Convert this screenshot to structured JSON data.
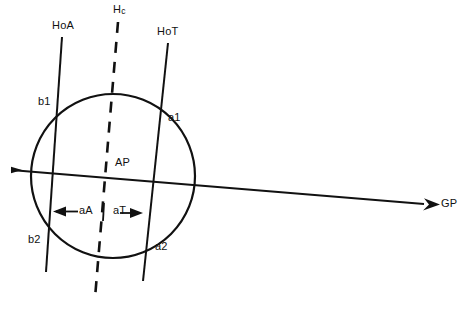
{
  "diagram": {
    "background_color": "#ffffff",
    "line_color": "#111111",
    "labels": {
      "hoa": "HoA",
      "hc_main": "H",
      "hc_sub": "c",
      "hot": "HoT",
      "b1": "b1",
      "a1": "a1",
      "b2": "b2",
      "a2": "a2",
      "ap": "AP",
      "aA": "aA",
      "aT": "aT",
      "gp": "GP"
    },
    "geometry": {
      "circle": {
        "cx": 113,
        "cy": 176,
        "r": 82
      },
      "gp_axis": {
        "x1": 11,
        "y1": 170,
        "x2": 430,
        "y2": 205
      },
      "hoa_axis": {
        "x1": 62,
        "y1": 37,
        "x2": 46,
        "y2": 272
      },
      "hot_axis": {
        "x1": 168,
        "y1": 43,
        "x2": 143,
        "y2": 281
      },
      "hc_axis": {
        "x1": 118,
        "y1": 22,
        "x2": 95,
        "y2": 298
      },
      "dim_row_y": 212,
      "aA_left_x": 55,
      "aT_right_x": 140,
      "hc_tick_x": 108
    }
  }
}
